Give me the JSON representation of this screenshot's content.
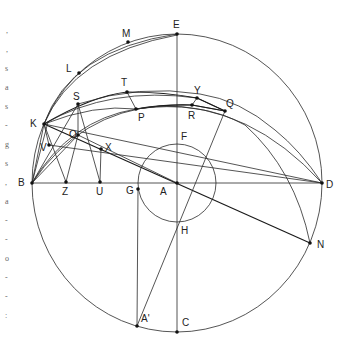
{
  "figure": {
    "points": {
      "A": {
        "label": "A",
        "x": 177,
        "y": 183
      },
      "B": {
        "label": "B",
        "x": 32,
        "y": 183
      },
      "C": {
        "label": "C",
        "x": 177,
        "y": 332
      },
      "D": {
        "label": "D",
        "x": 322,
        "y": 183
      },
      "E": {
        "label": "E",
        "x": 177,
        "y": 34
      },
      "F": {
        "label": "F",
        "x": 177,
        "y": 144
      },
      "G": {
        "label": "G",
        "x": 138,
        "y": 189
      },
      "H": {
        "label": "H",
        "x": 177,
        "y": 222
      },
      "K": {
        "label": "K",
        "x": 44,
        "y": 124
      },
      "L": {
        "label": "L",
        "x": 79,
        "y": 73
      },
      "M": {
        "label": "M",
        "x": 128,
        "y": 42
      },
      "N": {
        "label": "N",
        "x": 310,
        "y": 243
      },
      "O": {
        "label": "O",
        "x": 78,
        "y": 135
      },
      "P": {
        "label": "P",
        "x": 136,
        "y": 109
      },
      "Q": {
        "label": "Q",
        "x": 225,
        "y": 111
      },
      "R": {
        "label": "R",
        "x": 192,
        "y": 105
      },
      "S": {
        "label": "S",
        "x": 78,
        "y": 104
      },
      "T": {
        "label": "T",
        "x": 127,
        "y": 92
      },
      "U": {
        "label": "U",
        "x": 100,
        "y": 182
      },
      "V": {
        "label": "V",
        "x": 49,
        "y": 145
      },
      "X": {
        "label": "X",
        "x": 101,
        "y": 149
      },
      "Y": {
        "label": "Y",
        "x": 197,
        "y": 98
      },
      "Z": {
        "label": "Z",
        "x": 66,
        "y": 182
      },
      "A_prime": {
        "label": "A'",
        "x": 137,
        "y": 326
      }
    },
    "circles": {
      "outer": {
        "cx": 177,
        "cy": 183,
        "rx": 145,
        "ry": 149
      },
      "inner": {
        "cx": 177,
        "cy": 183,
        "r": 39
      }
    },
    "margin_text": [
      ",",
      ",",
      "s",
      "a",
      "s",
      "-",
      "g",
      "s",
      ",",
      "a",
      "-",
      "-",
      "o",
      "-",
      "-",
      ":"
    ]
  }
}
